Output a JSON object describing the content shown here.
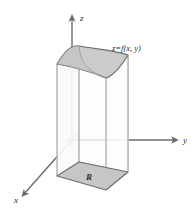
{
  "figure": {
    "kind": "3d-coordinate-diagram",
    "background_color": "#ffffff",
    "width": 194,
    "height": 215
  },
  "axes": {
    "z": {
      "label": "z",
      "direction": "up",
      "label_x": 80,
      "label_y": 21
    },
    "y": {
      "label": "y",
      "direction": "right",
      "label_x": 183,
      "label_y": 143
    },
    "x": {
      "label": "x",
      "direction": "down-left",
      "label_x": 14,
      "label_y": 203
    },
    "origin_x": 72,
    "origin_y": 140,
    "axis_color": "#6b6b6b",
    "axis_stroke_width": 1.4
  },
  "surface": {
    "label": "z=f(x, y)",
    "label_x": 112,
    "label_y": 51,
    "fill_color": "#cbcbcb",
    "edge_color": "#6e6e6e"
  },
  "region": {
    "label": "R",
    "label_x": 89,
    "label_y": 180,
    "fill_color": "#c6c6c6",
    "edge_color": "#6e6e6e"
  },
  "solid": {
    "side_fill_color": "#fbfbfb",
    "edge_color": "#b5b5b5",
    "description": "vertical prism between region R and surface z=f(x,y)"
  }
}
